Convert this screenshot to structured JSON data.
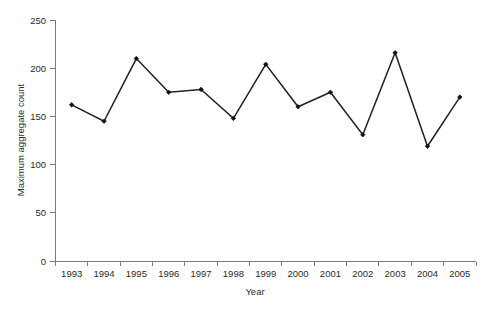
{
  "chart_data": {
    "type": "line",
    "title": "",
    "subtitle": "",
    "xlabel": "Year",
    "ylabel": "Maximum aggregate count",
    "categories": [
      "1993",
      "1994",
      "1995",
      "1996",
      "1997",
      "1998",
      "1999",
      "2000",
      "2001",
      "2002",
      "2003",
      "2004",
      "2005"
    ],
    "values": [
      162,
      145,
      210,
      175,
      178,
      148,
      204,
      160,
      175,
      131,
      216,
      119,
      170
    ],
    "series": [
      {
        "name": "Maximum aggregate count",
        "values": [
          162,
          145,
          210,
          175,
          178,
          148,
          204,
          160,
          175,
          131,
          216,
          119,
          170
        ]
      }
    ],
    "ylim": [
      0,
      250
    ],
    "yticks": [
      0,
      50,
      100,
      150,
      200,
      250
    ],
    "ytick_labels": [
      "0",
      "50",
      "100",
      "150",
      "200",
      "250"
    ],
    "xtick_labels": [
      "1993",
      "1994",
      "1995",
      "1996",
      "1997",
      "1998",
      "1999",
      "2000",
      "2001",
      "2002",
      "2003",
      "2004",
      "2005"
    ],
    "grid": false,
    "legend": false,
    "legend_position": "none",
    "marker": "diamond",
    "line_color": "#222222",
    "marker_color": "#111111",
    "axis_color": "#7a7a7a",
    "text_color": "#2b2b2b",
    "background_color": "#ffffff",
    "annotations": []
  },
  "axes": {
    "y_title": "Maximum aggregate count",
    "x_title": "Year"
  }
}
